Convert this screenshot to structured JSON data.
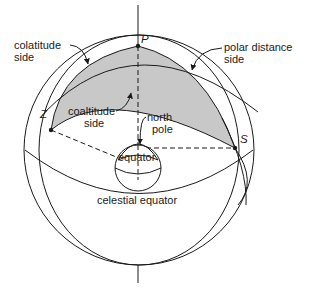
{
  "figure": {
    "points": {
      "P": "P",
      "Z": "Z",
      "S": "S"
    },
    "labels": {
      "colatitude_line1": "colatitude",
      "colatitude_line2": "side",
      "coaltitude_line1": "coaltitude",
      "coaltitude_line2": "side",
      "polar_line1": "polar distance",
      "polar_line2": "side",
      "north_line1": "north",
      "north_line2": "pole",
      "equator": "equator",
      "celestial_equator": "celestial equator"
    },
    "colors": {
      "line": "#1a1a1a",
      "triangle_fill": "#c8c8c8",
      "background": "#ffffff"
    }
  }
}
